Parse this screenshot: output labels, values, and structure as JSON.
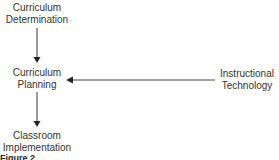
{
  "diagram": {
    "nodes": [
      {
        "id": "curriculum-determination",
        "lines": [
          "Curriculum",
          "Determination"
        ]
      },
      {
        "id": "curriculum-planning",
        "lines": [
          "Curriculum",
          "Planning"
        ]
      },
      {
        "id": "classroom-implementation",
        "lines": [
          "Classroom",
          "Implementation"
        ]
      },
      {
        "id": "instructional-technology",
        "lines": [
          "Instructional",
          "Technology"
        ]
      }
    ],
    "edges": [
      {
        "from": "curriculum-determination",
        "to": "curriculum-planning"
      },
      {
        "from": "curriculum-planning",
        "to": "classroom-implementation"
      },
      {
        "from": "instructional-technology",
        "to": "curriculum-planning"
      }
    ],
    "caption": "Figure 2"
  }
}
